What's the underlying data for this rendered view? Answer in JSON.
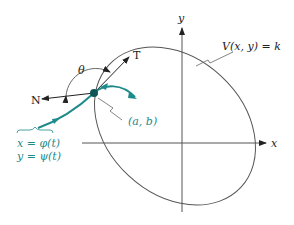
{
  "diagram": {
    "axes": {
      "x_label": "x",
      "y_label": "y"
    },
    "level_curve_label": "V(x, y) = k",
    "point_label": "(a, b)",
    "tangent_label": "T",
    "normal_label": "N",
    "angle_label": "θ",
    "trajectory_eq_x": "x = φ(t)",
    "trajectory_eq_y": "y = ψ(t)",
    "colors": {
      "trajectory": "#1f8a8a",
      "ink": "#333333"
    }
  }
}
